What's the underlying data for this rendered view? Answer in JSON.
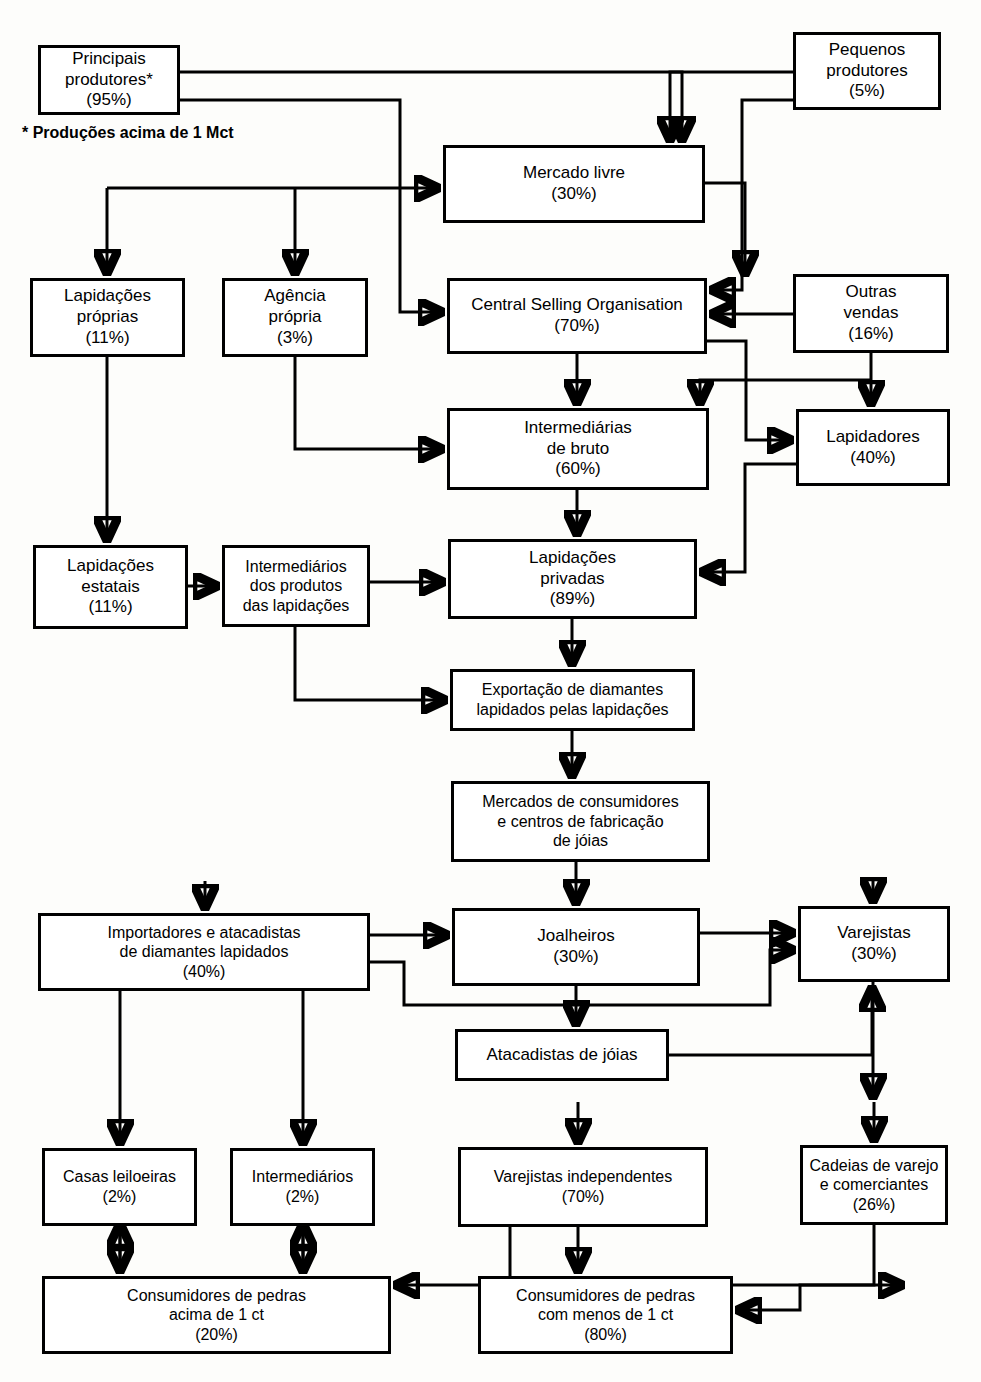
{
  "diagram": {
    "footnote": "* Produções acima de 1 Mct",
    "nodes": [
      {
        "id": "principais",
        "label": "Principais\nprodutores*\n(95%)",
        "x": 38,
        "y": 45,
        "w": 142,
        "h": 70
      },
      {
        "id": "pequenos",
        "label": "Pequenos\nprodutores\n(5%)",
        "x": 793,
        "y": 32,
        "w": 148,
        "h": 78
      },
      {
        "id": "mercado",
        "label": "Mercado livre\n(30%)",
        "x": 443,
        "y": 145,
        "w": 262,
        "h": 78
      },
      {
        "id": "lapid_proprias",
        "label": "Lapidações\npróprias\n(11%)",
        "x": 30,
        "y": 278,
        "w": 155,
        "h": 79
      },
      {
        "id": "agencia",
        "label": "Agência\nprópria\n(3%)",
        "x": 222,
        "y": 278,
        "w": 146,
        "h": 79
      },
      {
        "id": "cso",
        "label": "Central Selling Organisation\n(70%)",
        "x": 447,
        "y": 278,
        "w": 260,
        "h": 76
      },
      {
        "id": "outras",
        "label": "Outras\nvendas\n(16%)",
        "x": 793,
        "y": 274,
        "w": 156,
        "h": 79
      },
      {
        "id": "interm_bruto",
        "label": "Intermediárias\nde bruto\n(60%)",
        "x": 447,
        "y": 408,
        "w": 262,
        "h": 82
      },
      {
        "id": "lapidadores",
        "label": "Lapidadores\n(40%)",
        "x": 796,
        "y": 409,
        "w": 154,
        "h": 77
      },
      {
        "id": "lapid_estatais",
        "label": "Lapidações\nestatais\n(11%)",
        "x": 33,
        "y": 545,
        "w": 155,
        "h": 84
      },
      {
        "id": "interm_prod",
        "label": "Intermediários\ndos produtos\ndas lapidações",
        "x": 222,
        "y": 545,
        "w": 148,
        "h": 82
      },
      {
        "id": "lapid_privadas",
        "label": "Lapidações\nprivadas\n(89%)",
        "x": 448,
        "y": 539,
        "w": 249,
        "h": 80
      },
      {
        "id": "exportacao",
        "label": "Exportação de diamantes\nlapidados pelas lapidações",
        "x": 450,
        "y": 669,
        "w": 245,
        "h": 62
      },
      {
        "id": "mercados",
        "label": "Mercados de consumidores\ne centros de fabricação\nde jóias",
        "x": 451,
        "y": 781,
        "w": 259,
        "h": 81
      },
      {
        "id": "importadores",
        "label": "Importadores e atacadistas\nde diamantes lapidados\n(40%)",
        "x": 38,
        "y": 913,
        "w": 332,
        "h": 78
      },
      {
        "id": "joalheiros",
        "label": "Joalheiros\n(30%)",
        "x": 452,
        "y": 908,
        "w": 248,
        "h": 78
      },
      {
        "id": "varejistas",
        "label": "Varejistas\n(30%)",
        "x": 798,
        "y": 906,
        "w": 152,
        "h": 76
      },
      {
        "id": "atacadistas",
        "label": "Atacadistas de jóias",
        "x": 455,
        "y": 1029,
        "w": 214,
        "h": 52
      },
      {
        "id": "casas",
        "label": "Casas leiloeiras\n(2%)",
        "x": 42,
        "y": 1148,
        "w": 155,
        "h": 78
      },
      {
        "id": "intermediarios",
        "label": "Intermediários\n(2%)",
        "x": 230,
        "y": 1148,
        "w": 145,
        "h": 78
      },
      {
        "id": "varej_indep",
        "label": "Varejistas independentes\n(70%)",
        "x": 458,
        "y": 1147,
        "w": 250,
        "h": 80
      },
      {
        "id": "cadeias",
        "label": "Cadeias de varejo\ne comerciantes\n(26%)",
        "x": 800,
        "y": 1145,
        "w": 148,
        "h": 80
      },
      {
        "id": "consum_acima",
        "label": "Consumidores de pedras\nacima de 1 ct\n(20%)",
        "x": 42,
        "y": 1276,
        "w": 349,
        "h": 78
      },
      {
        "id": "consum_menos",
        "label": "Consumidores de pedras\ncom menos de 1 ct\n(80%)",
        "x": 478,
        "y": 1276,
        "w": 255,
        "h": 78
      }
    ],
    "edges": [
      {
        "from": "principais",
        "to": "mercado",
        "label": ""
      },
      {
        "from": "principais",
        "to": "cso",
        "label": ""
      },
      {
        "from": "principais",
        "to": "lapid_proprias",
        "label": ""
      },
      {
        "from": "principais",
        "to": "agencia",
        "label": ""
      },
      {
        "from": "pequenos",
        "to": "mercado",
        "label": ""
      },
      {
        "from": "pequenos",
        "to": "cso",
        "label": ""
      },
      {
        "from": "mercado",
        "to": "lapidadores",
        "label": ""
      },
      {
        "from": "mercado",
        "to": "cso",
        "label": ""
      },
      {
        "from": "outras",
        "to": "cso",
        "label": ""
      },
      {
        "from": "outras",
        "to": "lapidadores",
        "label": ""
      },
      {
        "from": "outras",
        "to": "interm_bruto",
        "label": ""
      },
      {
        "from": "cso",
        "to": "interm_bruto",
        "label": ""
      },
      {
        "from": "cso",
        "to": "lapidadores",
        "label": ""
      },
      {
        "from": "agencia",
        "to": "interm_bruto",
        "label": ""
      },
      {
        "from": "interm_bruto",
        "to": "lapid_privadas",
        "label": ""
      },
      {
        "from": "lapidadores",
        "to": "lapid_privadas",
        "label": ""
      },
      {
        "from": "lapid_proprias",
        "to": "lapid_estatais",
        "label": ""
      },
      {
        "from": "lapid_estatais",
        "to": "interm_prod",
        "label": ""
      },
      {
        "from": "interm_prod",
        "to": "lapid_privadas",
        "label": ""
      },
      {
        "from": "interm_prod",
        "to": "exportacao",
        "label": ""
      },
      {
        "from": "lapid_privadas",
        "to": "exportacao",
        "label": ""
      },
      {
        "from": "exportacao",
        "to": "mercados",
        "label": ""
      },
      {
        "from": "mercados",
        "to": "joalheiros",
        "label": ""
      },
      {
        "from": "mercados",
        "to": "importadores",
        "label": ""
      },
      {
        "from": "mercados",
        "to": "varejistas",
        "label": ""
      },
      {
        "from": "importadores",
        "to": "joalheiros",
        "label": ""
      },
      {
        "from": "importadores",
        "to": "varejistas",
        "label": ""
      },
      {
        "from": "joalheiros",
        "to": "varejistas",
        "label": ""
      },
      {
        "from": "joalheiros",
        "to": "atacadistas",
        "label": ""
      },
      {
        "from": "atacadistas",
        "to": "varejistas",
        "label": ""
      },
      {
        "from": "importadores",
        "to": "casas",
        "label": ""
      },
      {
        "from": "importadores",
        "to": "intermediarios",
        "label": ""
      },
      {
        "from": "varejistas",
        "to": "varej_indep",
        "label": ""
      },
      {
        "from": "varejistas",
        "to": "cadeias",
        "label": ""
      },
      {
        "from": "casas",
        "to": "consum_acima",
        "label": ""
      },
      {
        "from": "intermediarios",
        "to": "consum_acima",
        "label": ""
      },
      {
        "from": "varej_indep",
        "to": "consum_acima",
        "label": ""
      },
      {
        "from": "varej_indep",
        "to": "consum_menos",
        "label": ""
      },
      {
        "from": "cadeias",
        "to": "consum_menos",
        "label": ""
      }
    ]
  }
}
